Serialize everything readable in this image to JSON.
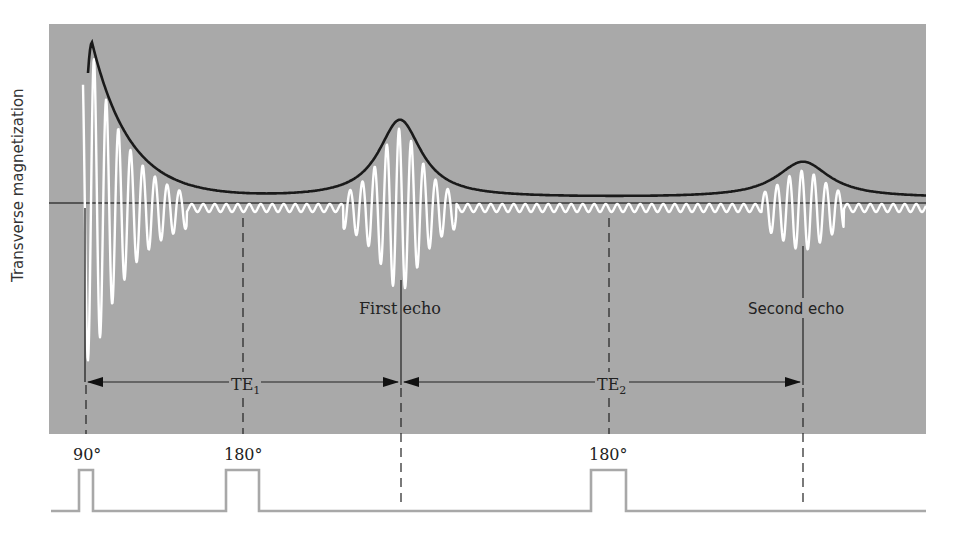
{
  "figure": {
    "y_axis_label": "Transverse magnetization",
    "labels": {
      "first_echo": "First echo",
      "second_echo": "Second echo",
      "te1": "TE",
      "te1_sub": "1",
      "te2": "TE",
      "te2_sub": "2"
    },
    "pulses": [
      {
        "label": "90°",
        "x_start": 79,
        "x_end": 93
      },
      {
        "label": "180°",
        "x_start": 226,
        "x_end": 259
      },
      {
        "label": "180°",
        "x_start": 591,
        "x_end": 626
      }
    ],
    "colors": {
      "panel": "#a9a9a9",
      "signal": "#ffffff",
      "envelope": "#1a1a1a",
      "pulse_line": "#a8a8a8",
      "text": "#222222"
    }
  },
  "chart_data": {
    "type": "line",
    "ylabel": "Transverse magnetization",
    "xlabel": "",
    "events": [
      {
        "name": "90° pulse",
        "x_px": 85
      },
      {
        "name": "180° pulse",
        "x_px": 243
      },
      {
        "name": "First echo",
        "x_px": 401
      },
      {
        "name": "180° pulse",
        "x_px": 609
      },
      {
        "name": "Second echo",
        "x_px": 803
      }
    ],
    "intervals": [
      {
        "name": "TE1",
        "from": "90° pulse",
        "to": "First echo"
      },
      {
        "name": "TE2",
        "from": "First echo",
        "to": "Second echo"
      }
    ],
    "envelope_peaks_relative": [
      {
        "event": "FID (after 90°)",
        "amplitude": 1.0
      },
      {
        "event": "First echo",
        "amplitude": 0.49
      },
      {
        "event": "Second echo",
        "amplitude": 0.23
      }
    ],
    "series": [
      {
        "name": "Signal (white oscillation)"
      },
      {
        "name": "Envelope (black)"
      }
    ]
  }
}
